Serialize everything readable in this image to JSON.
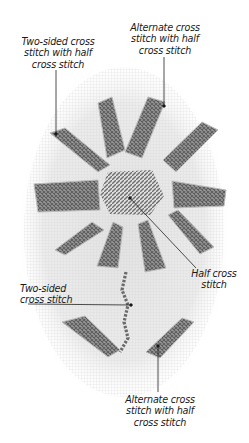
{
  "diagram": {
    "colors": {
      "background": "#ffffff",
      "fabric": "#e6e6e6",
      "stitch": "#7d7d7d",
      "stitch_dark": "#5e5e5e",
      "label_text": "#1a1a1a",
      "leader_line": "#222222"
    },
    "labels": [
      {
        "id": "top-left",
        "text": "Two-sided cross\nstitch with half\ncross stitch"
      },
      {
        "id": "top-right",
        "text": "Alternate cross\nstitch with half\ncross stitch"
      },
      {
        "id": "middle-right",
        "text": "Half cross\nstitch"
      },
      {
        "id": "middle-left",
        "text": "Two-sided\ncross stitch"
      },
      {
        "id": "bottom",
        "text": "Alternate cross\nstitch with half\ncross stitch"
      }
    ]
  }
}
